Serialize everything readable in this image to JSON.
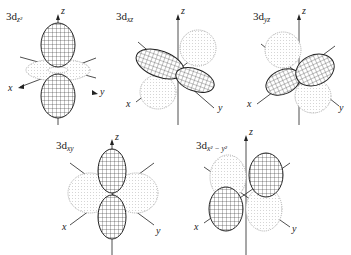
{
  "diagram": {
    "type": "d-orbital shapes",
    "orbitals": [
      {
        "id": "dz2",
        "prefix": "3d",
        "subscript": "z²",
        "axes": {
          "x": "x",
          "y": "y",
          "z": "z"
        }
      },
      {
        "id": "dxz",
        "prefix": "3d",
        "subscript": "xz",
        "axes": {
          "x": "x",
          "y": "y",
          "z": "z"
        }
      },
      {
        "id": "dyz",
        "prefix": "3d",
        "subscript": "yz",
        "axes": {
          "x": "x",
          "y": "y",
          "z": "z"
        }
      },
      {
        "id": "dxy",
        "prefix": "3d",
        "subscript": "xy",
        "axes": {
          "x": "x",
          "y": "y",
          "z": "z"
        }
      },
      {
        "id": "dx2y2",
        "prefix": "3d",
        "subscript": "x² − y²",
        "axes": {
          "x": "x",
          "y": "y",
          "z": "z"
        }
      }
    ],
    "legend_style": {
      "solid_lobe": "positive phase (meshed)",
      "dotted_lobe": "negative phase (dotted)"
    },
    "colors": {
      "line": "#222222",
      "dotted": "#9a9a9a",
      "background": "#ffffff"
    }
  }
}
